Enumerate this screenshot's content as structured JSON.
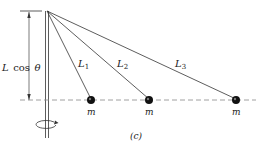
{
  "diagram": {
    "height_label": {
      "var": "L",
      "func": "cos",
      "angle": "θ"
    },
    "strings": [
      {
        "label": "L",
        "sub": "1"
      },
      {
        "label": "L",
        "sub": "2"
      },
      {
        "label": "L",
        "sub": "3"
      }
    ],
    "masses": [
      {
        "label": "m"
      },
      {
        "label": "m"
      },
      {
        "label": "m"
      }
    ],
    "panel_label": "(c)",
    "colors": {
      "line": "#333333",
      "dash": "#888888",
      "mass": "#111111"
    }
  }
}
